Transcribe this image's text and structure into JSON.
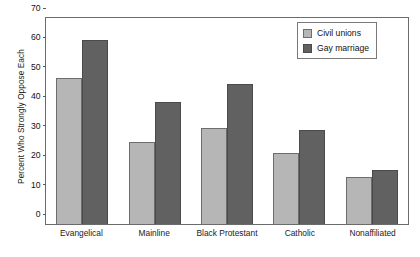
{
  "chart_data": {
    "type": "bar",
    "title": "",
    "xlabel": "",
    "ylabel": "Percent Who Strongly Oppose Each",
    "ylim": [
      0,
      70
    ],
    "yticks": [
      0,
      10,
      20,
      30,
      40,
      50,
      60,
      70
    ],
    "grid": false,
    "legend_position": "top-right",
    "categories": [
      "Evangelical",
      "Mainline",
      "Black Protestant",
      "Catholic",
      "Nonaffiliated"
    ],
    "series": [
      {
        "name": "Civil unions",
        "color": "#b6b6b6",
        "values": [
          49.5,
          27.8,
          32.5,
          24,
          16
        ]
      },
      {
        "name": "Gay marriage",
        "color": "#616161",
        "values": [
          62.6,
          41.5,
          47.5,
          32,
          18.5
        ]
      }
    ]
  }
}
